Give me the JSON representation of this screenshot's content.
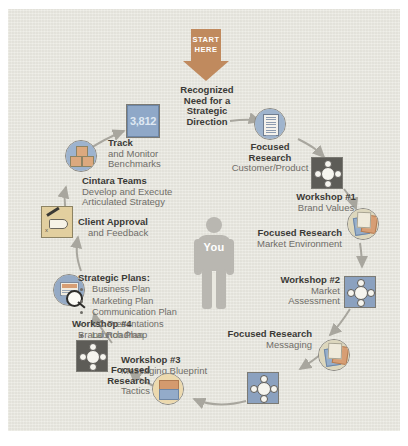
{
  "diagram": {
    "center_figure": {
      "label": "You",
      "icon": "person-icon"
    },
    "start": {
      "line1": "START",
      "line2": "HERE",
      "icon": "down-arrow-icon",
      "color": "#c08a5e"
    },
    "colors": {
      "page": "#e9e8e0",
      "arrow_orange": "#c08a5e",
      "accent_blue": "#8fa8c8",
      "dark_grey": "#5d5c57",
      "tan": "#e2cf9f",
      "heading_text": "#3b3a36",
      "sub_text": "#6f6d68"
    },
    "steps": [
      {
        "id": "recognized-need",
        "title": "Recognized\nNeed for a\nStrategic\nDirection",
        "subtitle": "",
        "icon": ""
      },
      {
        "id": "focused-research-1",
        "title": "Focused\nResearch",
        "subtitle": "Customer/Product",
        "icon": "document-icon"
      },
      {
        "id": "workshop-1",
        "title": "Workshop #1",
        "subtitle": "Brand Values",
        "icon": "meeting-table-icon"
      },
      {
        "id": "focused-research-2",
        "title": "Focused Research",
        "subtitle": "Market Environment",
        "icon": "research-papers-icon"
      },
      {
        "id": "workshop-2",
        "title": "Workshop #2",
        "subtitle": "Market\nAssessment",
        "icon": "meeting-table-icon"
      },
      {
        "id": "focused-research-3",
        "title": "Focused Research",
        "subtitle": "Messaging",
        "icon": "research-papers-icon"
      },
      {
        "id": "workshop-3",
        "title": "Workshop #3",
        "subtitle": "Messaging Blueprint",
        "icon": "meeting-table-icon"
      },
      {
        "id": "focused-research-4",
        "title": "Focused\nResearch",
        "subtitle": "Tactics",
        "icon": "tactics-stack-icon"
      },
      {
        "id": "workshop-4",
        "title": "Workshop #4",
        "subtitle": "Brand Roadmap",
        "icon": "meeting-table-icon"
      },
      {
        "id": "strategic-plans",
        "title": "Strategic Plans:",
        "subtitle": "",
        "icon": "magnifier-plan-icon"
      },
      {
        "id": "client-approval",
        "title": "Client Approval",
        "subtitle": "and Feedback",
        "icon": "signing-hand-icon"
      },
      {
        "id": "cintara-teams",
        "title": "Cintara Teams",
        "subtitle": "Develop and Execute\nArticulated Strategy",
        "icon": "blocks-icon"
      },
      {
        "id": "track-monitor",
        "title": "Track",
        "subtitle": "and Monitor\nBenchmarks",
        "icon": "metric-box-icon",
        "metric": "3,812"
      }
    ],
    "labels": {
      "recognized_need": "Recognized\nNeed for a\nStrategic\nDirection",
      "focused_research_1_t": "Focused\nResearch",
      "focused_research_1_s": "Customer/Product",
      "workshop1_t": "Workshop #1",
      "workshop1_s": "Brand Values",
      "focused_research_2_t": "Focused Research",
      "focused_research_2_s": "Market Environment",
      "workshop2_t": "Workshop #2",
      "workshop2_s": "Market\nAssessment",
      "focused_research_3_t": "Focused Research",
      "focused_research_3_s": "Messaging",
      "workshop3_t": "Workshop #3",
      "workshop3_s": "Messaging Blueprint",
      "focused_research_4_t": "Focused\nResearch",
      "focused_research_4_s": "Tactics",
      "workshop4_t": "Workshop #4",
      "workshop4_s": "Brand Roadmap",
      "client_approval_t": "Client Approval",
      "client_approval_s": "and Feedback",
      "cintara_t": "Cintara Teams",
      "cintara_s": "Develop and Execute\nArticulated Strategy",
      "track_t": "Track",
      "track_s": "and Monitor\nBenchmarks",
      "metric_value": "3,812"
    },
    "strategic_plans": {
      "heading": "Strategic Plans:",
      "items": [
        "Business Plan",
        "Marketing Plan",
        "Communication Plan",
        "VC Presentations",
        "Launch Plan"
      ]
    }
  }
}
